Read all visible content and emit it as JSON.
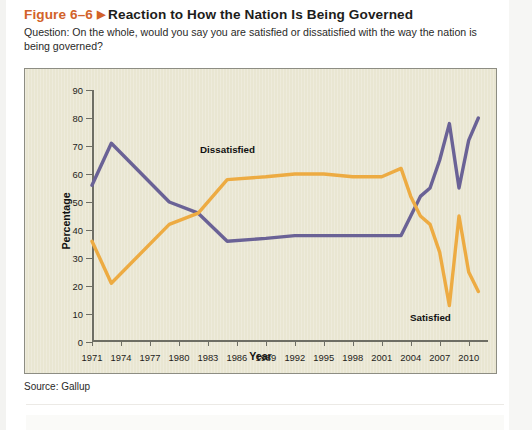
{
  "figure": {
    "number": "Figure 6–6",
    "marker": "▶",
    "title": "Reaction to How the Nation Is Being Governed",
    "question": "Question: On the whole, would you say you are satisfied or dissatisfied with the way the nation is being governed?",
    "source": "Source: Gallup",
    "accent_color": "#d2622a",
    "panel_background": "#e9e6d2"
  },
  "chart_data": {
    "type": "line",
    "title": "Reaction to How the Nation Is Being Governed",
    "xlabel": "Year",
    "ylabel": "Percentage",
    "xlim": [
      1971,
      2012
    ],
    "ylim": [
      0,
      90
    ],
    "xticks": [
      1971,
      1974,
      1977,
      1980,
      1983,
      1986,
      1989,
      1992,
      1995,
      1998,
      2001,
      2004,
      2007,
      2010
    ],
    "yticks": [
      0,
      10,
      20,
      30,
      40,
      50,
      60,
      70,
      80,
      90
    ],
    "grid": false,
    "legend": "inline-labels",
    "series": [
      {
        "name": "Dissatisfied",
        "color": "#6a6296",
        "label_position": "upper-left",
        "points": [
          [
            1971,
            56
          ],
          [
            1973,
            71
          ],
          [
            1979,
            50
          ],
          [
            1982,
            46
          ],
          [
            1985,
            36
          ],
          [
            1989,
            37
          ],
          [
            1992,
            38
          ],
          [
            1995,
            38
          ],
          [
            1998,
            38
          ],
          [
            2001,
            38
          ],
          [
            2003,
            38
          ],
          [
            2004,
            45
          ],
          [
            2005,
            52
          ],
          [
            2006,
            55
          ],
          [
            2007,
            65
          ],
          [
            2008,
            78
          ],
          [
            2009,
            55
          ],
          [
            2010,
            72
          ],
          [
            2011,
            80
          ]
        ]
      },
      {
        "name": "Satisfied",
        "color": "#edab42",
        "label_position": "lower-right",
        "points": [
          [
            1971,
            36
          ],
          [
            1973,
            21
          ],
          [
            1979,
            42
          ],
          [
            1982,
            46
          ],
          [
            1985,
            58
          ],
          [
            1989,
            59
          ],
          [
            1992,
            60
          ],
          [
            1995,
            60
          ],
          [
            1998,
            59
          ],
          [
            2001,
            59
          ],
          [
            2003,
            62
          ],
          [
            2004,
            52
          ],
          [
            2005,
            45
          ],
          [
            2006,
            42
          ],
          [
            2007,
            32
          ],
          [
            2008,
            13
          ],
          [
            2009,
            45
          ],
          [
            2010,
            25
          ],
          [
            2011,
            18
          ]
        ]
      }
    ]
  }
}
